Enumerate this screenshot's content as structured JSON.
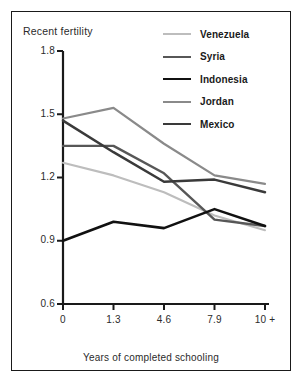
{
  "figure": {
    "title": "Recent fertility",
    "xaxis_title": "Years of completed schooling",
    "border_color": "#1a1a1a",
    "background": "#ffffff"
  },
  "legend": {
    "position": "top-right",
    "entries": [
      {
        "label": "Venezuela",
        "color": "#bdbdbd",
        "width": 2.1
      },
      {
        "label": "Syria",
        "color": "#575757",
        "width": 2.4
      },
      {
        "label": "Indonesia",
        "color": "#111111",
        "width": 2.6
      },
      {
        "label": "Jordan",
        "color": "#8a8a8a",
        "width": 2.2
      },
      {
        "label": "Mexico",
        "color": "#3a3a3a",
        "width": 2.5
      }
    ]
  },
  "axes": {
    "y_ticks": [
      "1.8",
      "1.5",
      "1.2",
      "0.9",
      "0.6"
    ],
    "y_tick_values": [
      1.8,
      1.5,
      1.2,
      0.9,
      0.6
    ],
    "x_ticks": [
      "0",
      "1.3",
      "4.6",
      "7.9",
      "10 +"
    ]
  },
  "chart_data": {
    "type": "line",
    "title": "Recent fertility",
    "xlabel": "Years of completed schooling",
    "ylabel": "Recent fertility",
    "categories": [
      "0",
      "1.3",
      "4.6",
      "7.9",
      "10 +"
    ],
    "ylim": [
      0.6,
      1.8
    ],
    "ytick_step": 0.3,
    "grid": false,
    "legend_position": "top-right",
    "series": [
      {
        "name": "Venezuela",
        "color": "#bdbdbd",
        "values": [
          1.27,
          1.21,
          1.13,
          1.02,
          0.95
        ]
      },
      {
        "name": "Syria",
        "color": "#575757",
        "values": [
          1.35,
          1.35,
          1.22,
          1.0,
          0.97
        ]
      },
      {
        "name": "Indonesia",
        "color": "#111111",
        "values": [
          0.9,
          0.99,
          0.96,
          1.05,
          0.97
        ]
      },
      {
        "name": "Jordan",
        "color": "#8a8a8a",
        "values": [
          1.48,
          1.53,
          1.36,
          1.21,
          1.17
        ]
      },
      {
        "name": "Mexico",
        "color": "#3a3a3a",
        "values": [
          1.47,
          1.32,
          1.18,
          1.19,
          1.13
        ]
      }
    ]
  }
}
